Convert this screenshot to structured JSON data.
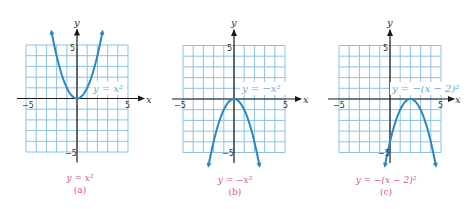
{
  "figure": {
    "colors": {
      "grid": "#8cc3e3",
      "curve": "#2a86c0",
      "caption": "#d05a88",
      "equation_label": "#6aaad2",
      "axis": "#1a1a1a"
    },
    "axis_labels": {
      "x": "x",
      "y": "y"
    },
    "tick_labels": {
      "neg": "−5",
      "pos": "5"
    },
    "panels": [
      {
        "id": "a",
        "equation_label": "y = x²",
        "caption_eq": "y = x²",
        "caption_letter": "(a)"
      },
      {
        "id": "b",
        "equation_label": "y = −x²",
        "caption_eq": "y = −x²",
        "caption_letter": "(b)"
      },
      {
        "id": "c",
        "equation_label": "y = −(x − 2)²",
        "caption_eq": "y = −(x − 2)²",
        "caption_letter": "(c)"
      }
    ]
  },
  "chart_data": [
    {
      "type": "line",
      "title": "y = x²",
      "xlabel": "x",
      "ylabel": "y",
      "xlim": [
        -5,
        5
      ],
      "ylim": [
        -5,
        5
      ],
      "grid": true,
      "x": [
        -2.5,
        -2,
        -1,
        0,
        1,
        2,
        2.5
      ],
      "values": [
        6.25,
        4,
        1,
        0,
        1,
        4,
        6.25
      ],
      "vertex": [
        0,
        0
      ]
    },
    {
      "type": "line",
      "title": "y = −x²",
      "xlabel": "x",
      "ylabel": "y",
      "xlim": [
        -5,
        5
      ],
      "ylim": [
        -5,
        5
      ],
      "grid": true,
      "x": [
        -2.5,
        -2,
        -1,
        0,
        1,
        2,
        2.5
      ],
      "values": [
        -6.25,
        -4,
        -1,
        0,
        -1,
        -4,
        -6.25
      ],
      "vertex": [
        0,
        0
      ]
    },
    {
      "type": "line",
      "title": "y = −(x − 2)²",
      "xlabel": "x",
      "ylabel": "y",
      "xlim": [
        -5,
        5
      ],
      "ylim": [
        -5,
        5
      ],
      "grid": true,
      "x": [
        -0.5,
        0,
        1,
        2,
        3,
        4,
        4.5
      ],
      "values": [
        -6.25,
        -4,
        -1,
        0,
        -1,
        -4,
        -6.25
      ],
      "vertex": [
        2,
        0
      ]
    }
  ]
}
